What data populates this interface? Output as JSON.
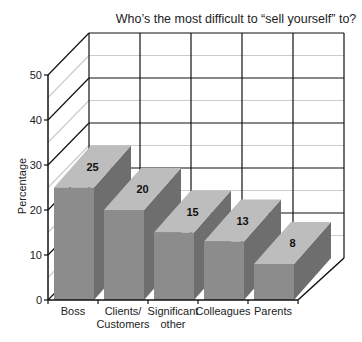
{
  "chart_data": {
    "type": "bar",
    "style": "3d",
    "title": "Who’s the most difficult to “sell yourself” to?",
    "xlabel": "",
    "ylabel": "Percentage",
    "ylim": [
      0,
      50
    ],
    "yticks": [
      0,
      10,
      20,
      30,
      40,
      50
    ],
    "grid": true,
    "categories": [
      "Boss",
      "Clients/\nCustomers",
      "Significant\nother",
      "Colleagues",
      "Parents"
    ],
    "values": [
      25,
      20,
      15,
      13,
      8
    ],
    "data_labels": [
      "25",
      "20",
      "15",
      "13",
      "8"
    ],
    "legend": null
  },
  "colors": {
    "front": "#8c8c8c",
    "side": "#6e6e6e",
    "top": "#bdbdbd",
    "axis": "#111111",
    "gridMajor": "#111111",
    "gridMinor": "#cccccc"
  }
}
